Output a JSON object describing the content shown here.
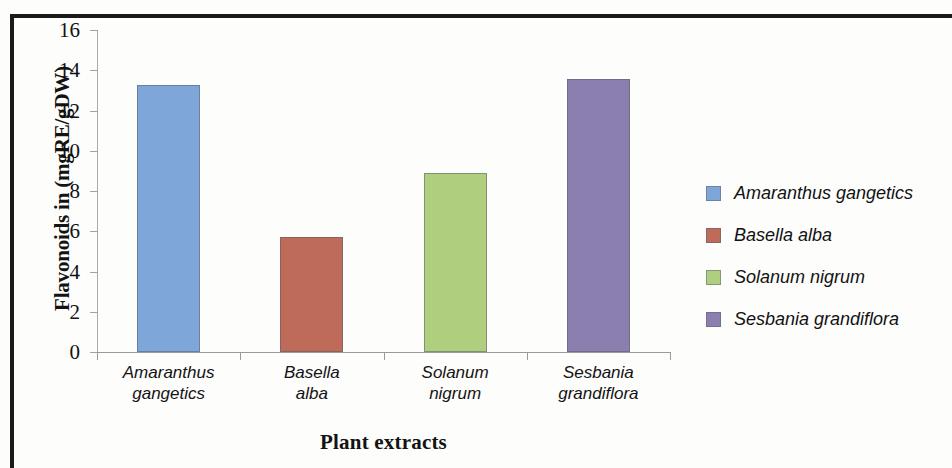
{
  "chart_data": {
    "type": "bar",
    "title": "",
    "xlabel": "Plant extracts",
    "ylabel": "Flavonoids in (mgRE/gDW)",
    "categories": [
      "Amaranthus gangetics",
      "Basella alba",
      "Solanum nigrum",
      "Sesbania grandiflora"
    ],
    "category_lines": [
      [
        "Amaranthus",
        "gangetics"
      ],
      [
        "Basella",
        "alba"
      ],
      [
        "Solanum",
        "nigrum"
      ],
      [
        "Sesbania",
        "grandiflora"
      ]
    ],
    "values": [
      13.25,
      5.7,
      8.9,
      13.55
    ],
    "colors": [
      "#7FA6D8",
      "#BE6B5A",
      "#AFCE7E",
      "#8B7FB0"
    ],
    "ylim": [
      0,
      16
    ],
    "ytick_labels": [
      "16",
      "14",
      "12",
      "10",
      "8",
      "6",
      "4",
      "2",
      "0"
    ],
    "ytick_values": [
      16,
      14,
      12,
      10,
      8,
      6,
      4,
      2,
      0
    ],
    "grid": false,
    "legend_position": "right",
    "legend": [
      {
        "label": "Amaranthus gangetics",
        "color": "#7FA6D8"
      },
      {
        "label": "Basella alba",
        "color": "#BE6B5A"
      },
      {
        "label": "Solanum nigrum",
        "color": "#AFCE7E"
      },
      {
        "label": "Sesbania grandiflora",
        "color": "#8B7FB0"
      }
    ]
  }
}
